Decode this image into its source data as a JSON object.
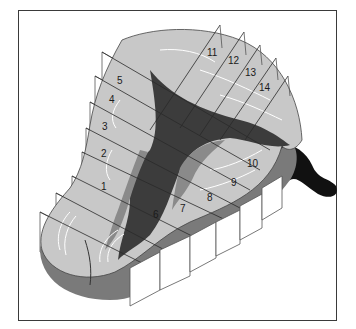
{
  "figure": {
    "frame_color": "#3a3a3a",
    "colors": {
      "surface_light": "#c8c8c8",
      "surface_mid": "#8a8a8a",
      "core_dark": "#3c3c3c",
      "underside": "#7a7a7a",
      "posterior_black": "#111111",
      "plane_line": "#2a2a2a"
    },
    "section_labels": [
      "1",
      "2",
      "3",
      "4",
      "5",
      "6",
      "7",
      "8",
      "9",
      "10",
      "11",
      "12",
      "13",
      "14"
    ]
  }
}
